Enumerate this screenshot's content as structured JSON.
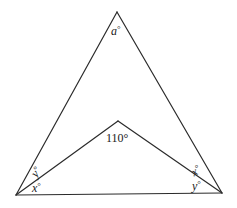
{
  "diagram": {
    "type": "geometry-triangle-with-inner-vertex",
    "stroke_color": "#2b2b2b",
    "vertices": {
      "top": {
        "x": 117,
        "y": 12
      },
      "left": {
        "x": 16,
        "y": 195
      },
      "right": {
        "x": 222,
        "y": 193
      },
      "inner": {
        "x": 118,
        "y": 121
      }
    },
    "labels": {
      "top_angle": {
        "var": "a",
        "deg": "°"
      },
      "inner_angle": {
        "text": "110°"
      },
      "left_upper": {
        "var": "y",
        "deg": "°"
      },
      "left_lower": {
        "var": "x",
        "deg": "°"
      },
      "right_upper": {
        "var": "x",
        "deg": "°"
      },
      "right_lower": {
        "var": "y",
        "deg": "°"
      }
    }
  }
}
